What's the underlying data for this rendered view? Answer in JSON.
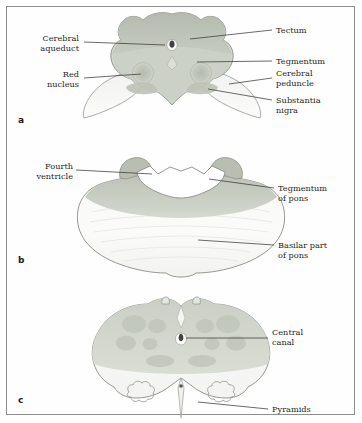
{
  "figure": {
    "background": "#ffffff",
    "border_color": "#8d8d8d"
  },
  "palette": {
    "tectum": "#b9bfb4",
    "tegmentum": "#cdd2c8",
    "peduncle": "#eceee9",
    "red_nucleus": "#c2c7bc",
    "substantia_nigra": "#b4bbae",
    "pons_tegmentum": "#c5cabf",
    "pons_basilar": "#f4f5f2",
    "medulla_upper": "#cfd4ca",
    "medulla_pyramid": "#fafbf8",
    "outline": "#8a8d86",
    "leader_line": "#3a3a3a",
    "text": "#1f1f1f"
  },
  "panels": [
    {
      "letter": "a",
      "name": "midbrain-section",
      "labels_left": [
        {
          "id": "cerebral-aqueduct",
          "text": "Cerebral\naqueduct"
        },
        {
          "id": "red-nucleus",
          "text": "Red\nnucleus"
        }
      ],
      "labels_right": [
        {
          "id": "tectum",
          "text": "Tectum"
        },
        {
          "id": "tegmentum",
          "text": "Tegmentum"
        },
        {
          "id": "cerebral-peduncle",
          "text": "Cerebral\npeduncle"
        },
        {
          "id": "substantia-nigra",
          "text": "Substantia\nnigra"
        }
      ]
    },
    {
      "letter": "b",
      "name": "pons-section",
      "labels_left": [
        {
          "id": "fourth-ventricle",
          "text": "Fourth\nventricle"
        }
      ],
      "labels_right": [
        {
          "id": "tegmentum-of-pons",
          "text": "Tegmentum\nof pons"
        },
        {
          "id": "basilar-part-of-pons",
          "text": "Basilar part\nof pons"
        }
      ]
    },
    {
      "letter": "c",
      "name": "medulla-section",
      "labels_left": [],
      "labels_right": [
        {
          "id": "central-canal",
          "text": "Central\ncanal"
        },
        {
          "id": "pyramids",
          "text": "Pyramids"
        }
      ]
    }
  ]
}
